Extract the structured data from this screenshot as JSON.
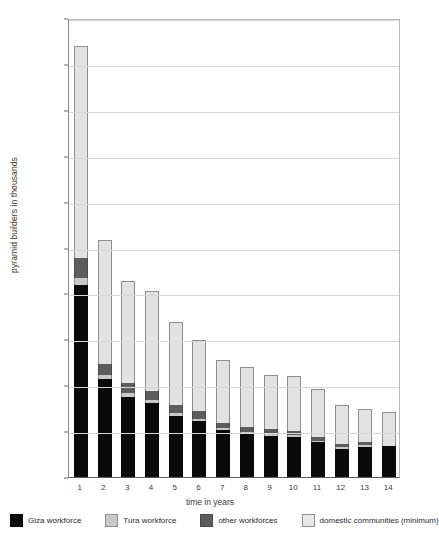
{
  "chart_data": {
    "type": "bar",
    "stacked": true,
    "title": "",
    "xlabel": "time in years",
    "ylabel": "pyramid builders in thousands",
    "categories": [
      "1",
      "2",
      "3",
      "4",
      "5",
      "6",
      "7",
      "8",
      "9",
      "10",
      "11",
      "12",
      "13",
      "14"
    ],
    "ylim": [
      0,
      50000
    ],
    "ytick_values": [
      0,
      5000,
      10000,
      15000,
      20000,
      25000,
      30000,
      35000,
      40000,
      45000,
      50000
    ],
    "ytick_labels": [
      "0.00",
      "5,000.00",
      "10,000.00",
      "15,000.00",
      "20,000.00",
      "25,000.00",
      "30,000.00",
      "35,000.00",
      "40,000.00",
      "45,000.00",
      "50,000.00"
    ],
    "grid": true,
    "legend_position": "bottom",
    "series": [
      {
        "name": "Giza workforce",
        "color": "#0a0a0a",
        "values": [
          20900,
          10700,
          8700,
          8100,
          6700,
          6100,
          5100,
          4700,
          4500,
          4400,
          3800,
          3100,
          3300,
          3400
        ]
      },
      {
        "name": "Tura workforce",
        "color": "#c9c9c9",
        "values": [
          800,
          400,
          400,
          300,
          300,
          250,
          200,
          200,
          200,
          150,
          150,
          150,
          150,
          0
        ]
      },
      {
        "name": "other workforces",
        "color": "#5d5d5d",
        "values": [
          2200,
          1200,
          1100,
          1000,
          900,
          800,
          600,
          500,
          500,
          450,
          400,
          400,
          350,
          0
        ]
      },
      {
        "name": "domestic communities (minimum)",
        "color": "#e2e2e2",
        "values": [
          23100,
          13500,
          11100,
          10900,
          9000,
          7800,
          6900,
          6600,
          5900,
          6000,
          5200,
          4250,
          3600,
          3700
        ]
      }
    ],
    "totals": [
      47000,
      25800,
      21300,
      20300,
      16900,
      14950,
      12800,
      12000,
      11100,
      11000,
      9550,
      7900,
      7400,
      7100
    ]
  },
  "legend": {
    "items": [
      {
        "label": "Giza workforce",
        "swatch": "giza"
      },
      {
        "label": "Tura workforce",
        "swatch": "tura"
      },
      {
        "label": "other workforces",
        "swatch": "other"
      },
      {
        "label": "domestic communities (minimum)",
        "swatch": "dom"
      }
    ]
  }
}
